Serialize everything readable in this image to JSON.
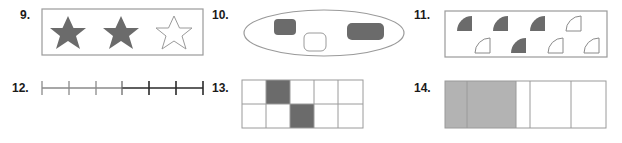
{
  "colors": {
    "dark_fill": "#6b6b6b",
    "light_fill": "#b3b3b3",
    "outline": "#9a9a9a",
    "label": "#1a1a1a"
  },
  "problems": [
    {
      "number": "9.",
      "figure": "stars",
      "total": 3,
      "shaded": 2
    },
    {
      "number": "10.",
      "figure": "ellipse-set",
      "shapes": [
        {
          "kind": "rounded-square",
          "shaded": true
        },
        {
          "kind": "rounded-square",
          "shaded": false
        },
        {
          "kind": "rounded-rectangle",
          "shaded": true
        }
      ]
    },
    {
      "number": "11.",
      "figure": "quarter-circles",
      "total": 8,
      "shaded": 4,
      "rows": [
        [
          true,
          true,
          true,
          false
        ],
        [
          false,
          true,
          false,
          false
        ]
      ]
    },
    {
      "number": "12.",
      "figure": "number-line",
      "segments": 6,
      "highlighted_segments": 3
    },
    {
      "number": "13.",
      "figure": "grid",
      "rows": 2,
      "cols": 5,
      "shaded_cells": [
        [
          0,
          1
        ],
        [
          1,
          2
        ]
      ]
    },
    {
      "number": "14.",
      "figure": "unequal-parts-bar",
      "parts": 5,
      "shaded_parts": 2
    }
  ]
}
